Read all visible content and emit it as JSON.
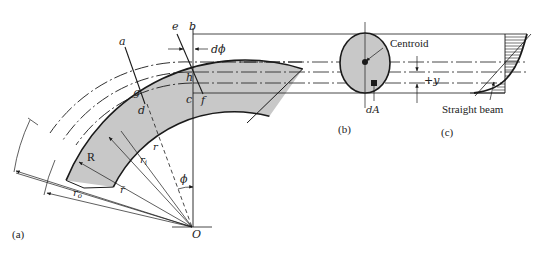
{
  "figure": {
    "panels": [
      {
        "id": "a",
        "label": "(a)"
      },
      {
        "id": "b",
        "label": "(b)"
      },
      {
        "id": "c",
        "label": "(c)"
      }
    ],
    "points": {
      "a": "a",
      "b": "b",
      "c": "c",
      "d": "d",
      "e": "e",
      "f": "f",
      "g": "g",
      "h": "h",
      "O": "O",
      "R": "R"
    },
    "symbols": {
      "dphi": "dϕ",
      "phi": "ϕ",
      "r": "r",
      "r_i": "r",
      "r_i_sub": "i",
      "r_bar": "r̄",
      "r_o": "r",
      "r_o_sub": "o",
      "plus_y": "+y",
      "dA": "dA"
    },
    "annotations": {
      "centroid": "Centroid",
      "straight_beam": "Straight beam"
    },
    "colors": {
      "fill": "#c8c8c8",
      "stroke": "#1a1a1a",
      "background": "#ffffff"
    }
  }
}
